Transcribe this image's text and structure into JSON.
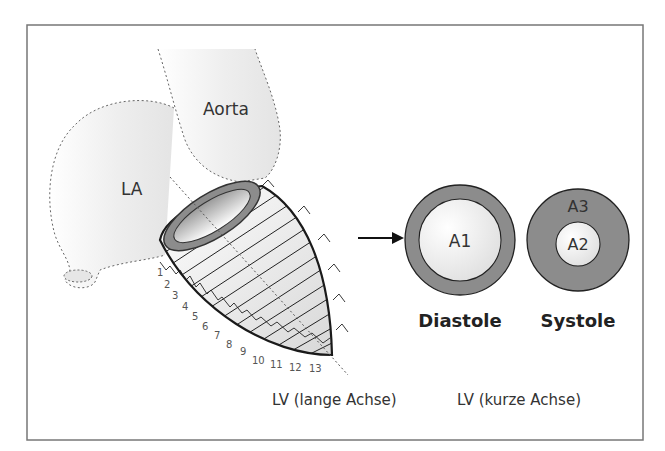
{
  "figure": {
    "frame_color": "#777777",
    "background": "#ffffff",
    "labels": {
      "aorta": "Aorta",
      "la": "LA",
      "a1": "A1",
      "a2": "A2",
      "a3": "A3",
      "diastole": "Diastole",
      "systole": "Systole",
      "lv_long_axis": "LV (lange Achse)",
      "lv_short_axis": "LV (kurze Achse)"
    },
    "slice_numbers": [
      "1",
      "2",
      "3",
      "4",
      "5",
      "6",
      "7",
      "8",
      "9",
      "10",
      "11",
      "12",
      "13"
    ],
    "colors": {
      "wall_gray": "#8c8c8c",
      "outline": "#1a1a1a",
      "dotted": "#666666",
      "cavity_light": "#f4f4f4"
    }
  }
}
